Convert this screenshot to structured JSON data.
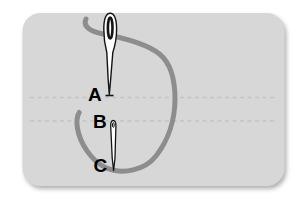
{
  "figure": {
    "type": "sewing-stitch-diagram",
    "labels": {
      "point_a": "A",
      "point_b": "B",
      "point_c": "C"
    },
    "icons": {
      "upper": "threaded-needle-icon",
      "lower": "piercing-needle-icon",
      "thread": "thread-loop"
    },
    "colors": {
      "page_background": "#ffffff",
      "fabric": "#d7d7d7",
      "thread": "#8d8d8d",
      "stitch_guide_line": "#c3c3c3",
      "needle_fill": "#ffffff",
      "needle_outline": "#141414",
      "label_text": "#000000"
    }
  }
}
